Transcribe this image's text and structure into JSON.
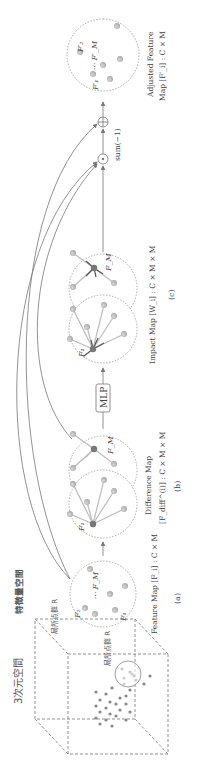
{
  "panels": {
    "space3d": {
      "title": "3次元空間",
      "local_group": "局所点群 R"
    },
    "feature_space": {
      "title": "特徴量空間",
      "local_group": "局所点群 R"
    },
    "a": {
      "label": "(a)",
      "caption": "Feature Map [F_i] : C × M",
      "nodes": [
        "F₁",
        "F₂",
        "⋯ F_M"
      ]
    },
    "b": {
      "label": "(b)",
      "caption_line1": "Difference Map",
      "caption_line2": "[F_diff^(i)] : C × M × M",
      "nodes": [
        "F₁",
        "F_M"
      ]
    },
    "mlp": {
      "label": "MLP"
    },
    "c": {
      "label": "(c)",
      "caption": "Impact Map [W_i] : C × M × M",
      "nodes": [
        "F₁",
        "F_M"
      ]
    },
    "ops": {
      "hadamard": "⊙",
      "add": "⊕",
      "sum": "sum(−1)"
    },
    "output": {
      "caption_line1": "Adjusted Feature",
      "caption_line2": "Map [F′_i] : C × M",
      "nodes": [
        "F′₁",
        "F′₂",
        "⋯ F′_M"
      ]
    }
  },
  "colors": {
    "line": "#888888",
    "node": "#b5b5b5",
    "node_dark": "#777777",
    "text": "#444444"
  }
}
